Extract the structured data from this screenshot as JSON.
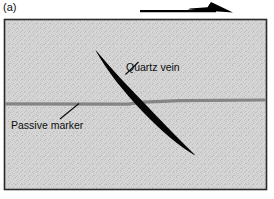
{
  "figure": {
    "panel_label": "(a)",
    "background_color": "#ffffff"
  },
  "shear_arrow": {
    "icon": "right-arrow-icon",
    "direction": "right",
    "color": "#000000",
    "description": "top shear sense arrow pointing right"
  },
  "diagram": {
    "box": {
      "fill_color": "#d4d4d4",
      "border_color": "#262626",
      "texture": "stipple"
    },
    "features": [
      {
        "name": "quartz-vein",
        "label": "Quartz vein",
        "color": "#000000",
        "shape": "sigmoidal-lens",
        "orientation": "top-left to bottom-right"
      },
      {
        "name": "passive-marker",
        "label": "Passive marker",
        "color": "#808080",
        "shape": "horizontal-band",
        "offset": "displaced across vein"
      }
    ]
  },
  "labels": {
    "quartz_vein": "Quartz vein",
    "passive_marker": "Passive marker"
  }
}
